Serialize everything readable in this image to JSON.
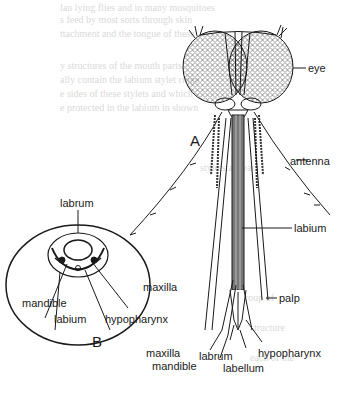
{
  "figure": {
    "panel_a": {
      "letter": "A",
      "labels": {
        "eye": "eye",
        "antenna": "antenna",
        "labium": "labium",
        "palp": "palp",
        "maxilla": "maxilla",
        "mandible": "mandible",
        "labrum": "labrum",
        "labellum": "labellum",
        "hypopharynx": "hypopharynx"
      }
    },
    "panel_b": {
      "letter": "B",
      "labels": {
        "labrum": "labrum",
        "maxilla": "maxilla",
        "mandible": "mandible",
        "labium": "labium",
        "hypopharynx": "hypopharynx"
      }
    },
    "colors": {
      "ink": "#1a1a1a",
      "background": "#ffffff",
      "bleed_through": "#d9d9d9"
    }
  }
}
